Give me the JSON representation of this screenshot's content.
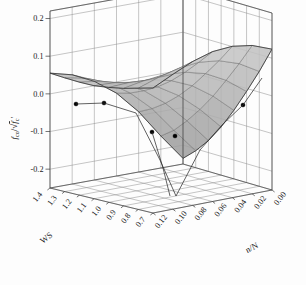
{
  "chart_data": {
    "type": "surface",
    "title": "",
    "subtitle": "",
    "xlabel": "WS",
    "ylabel": "n/N",
    "zlabel": "f_co / sqrt(f'_c)",
    "zlabel_parts": {
      "numerator": "f",
      "numerator_sub": "co",
      "divider": "/",
      "radicand": "f",
      "radicand_sub": "c"
    },
    "grid": true,
    "legend": "none",
    "x_ticks": [
      "1.4",
      "1.3",
      "1.2",
      "1.1",
      "1.0",
      "0.9",
      "0.8",
      "0.7"
    ],
    "x_values": [
      1.4,
      1.3,
      1.2,
      1.1,
      1.0,
      0.9,
      0.8,
      0.7
    ],
    "xlim": [
      0.7,
      1.4
    ],
    "y_ticks": [
      "0.12",
      "0.10",
      "0.08",
      "0.06",
      "0.04",
      "0.02",
      "0.00"
    ],
    "y_values": [
      0.12,
      0.1,
      0.08,
      0.06,
      0.04,
      0.02,
      0.0
    ],
    "ylim": [
      0.0,
      0.12
    ],
    "z_ticks": [
      "0.2",
      "0.1",
      "0.0",
      "-0.1",
      "-0.2"
    ],
    "z_values": [
      0.2,
      0.1,
      0.0,
      -0.1,
      -0.2
    ],
    "zlim": [
      -0.25,
      0.22
    ],
    "surface_color": "#b9b9b9",
    "surface_edge_color": "#555555",
    "marker_color": "#000000",
    "x_grid_divisions": 7,
    "y_grid_divisions": 6,
    "z_grid_divisions": 5,
    "surface_description": "Saddle-shaped response surface rising to a ridge peak near WS=0.7, n/N=0.00 and dipping into a sharp V-shaped valley near WS=0.9, n/N=0.06",
    "z_surface_grid": [
      [
        0.055,
        0.04,
        0.012,
        -0.03,
        -0.09,
        -0.165,
        -0.235
      ],
      [
        0.052,
        0.04,
        0.018,
        -0.02,
        -0.072,
        -0.14,
        -0.205
      ],
      [
        0.05,
        0.042,
        0.026,
        -0.004,
        -0.048,
        -0.105,
        -0.168
      ],
      [
        0.05,
        0.048,
        0.038,
        0.016,
        -0.018,
        -0.065,
        -0.122
      ],
      [
        0.055,
        0.058,
        0.055,
        0.042,
        0.018,
        -0.02,
        -0.068
      ],
      [
        0.062,
        0.072,
        0.078,
        0.074,
        0.06,
        0.032,
        -0.008
      ],
      [
        0.072,
        0.09,
        0.104,
        0.11,
        0.104,
        0.086,
        0.055
      ],
      [
        0.082,
        0.108,
        0.132,
        0.148,
        0.152,
        0.144,
        0.124
      ]
    ],
    "data_points": [
      {
        "ws": 1.4,
        "nN": 0.0,
        "z": 0.055,
        "px": 76,
        "py": 104
      },
      {
        "ws": 1.22,
        "nN": 0.005,
        "z": 0.052,
        "px": 104,
        "py": 103
      },
      {
        "ws": 1.05,
        "nN": 0.045,
        "z": -0.02,
        "px": 152,
        "py": 132
      },
      {
        "ws": 0.95,
        "nN": 0.03,
        "z": -0.038,
        "px": 175,
        "py": 136
      },
      {
        "ws": 0.76,
        "nN": 0.022,
        "z": 0.062,
        "px": 243,
        "py": 105
      }
    ]
  },
  "axes": {
    "z": {
      "title_text": "f_co / √f'_c",
      "ticks": [
        "0.2",
        "0.1",
        "0.0",
        "-0.1",
        "-0.2"
      ]
    },
    "x": {
      "title_text": "WS",
      "ticks": [
        "1.4",
        "1.3",
        "1.2",
        "1.1",
        "1.0",
        "0.9",
        "0.8",
        "0.7"
      ]
    },
    "y": {
      "title_text": "n/N",
      "ticks": [
        "0.12",
        "0.10",
        "0.08",
        "0.06",
        "0.04",
        "0.02",
        "0.00"
      ]
    }
  }
}
